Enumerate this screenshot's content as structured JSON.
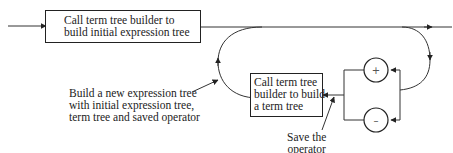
{
  "diagram": {
    "type": "syntax-flowchart",
    "boxes": [
      {
        "id": "initial",
        "lines": [
          "Call term tree builder to",
          "build initial expression tree"
        ]
      },
      {
        "id": "term",
        "lines": [
          "Call term tree",
          "builder to build",
          "a term tree"
        ]
      }
    ],
    "operators": [
      {
        "id": "plus",
        "symbol": "+"
      },
      {
        "id": "minus",
        "symbol": "–"
      }
    ],
    "annotations": [
      {
        "id": "build-new",
        "lines": [
          "Build a new expression tree",
          "with initial expression tree,",
          "term tree and saved operator"
        ]
      },
      {
        "id": "save-op",
        "lines": [
          "Save the",
          "operator"
        ]
      }
    ]
  }
}
